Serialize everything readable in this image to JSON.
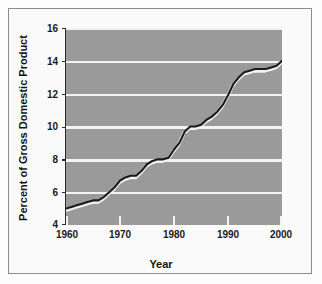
{
  "figure": {
    "background_color": "#fdfdfd",
    "frame_color": "#8c8c8c"
  },
  "chart_data": {
    "type": "line",
    "title": "",
    "xlabel": "Year",
    "ylabel": "Percent of Gross Domestic Product",
    "xlim": [
      1960,
      2000
    ],
    "ylim": [
      4,
      16
    ],
    "xticks": [
      "1960",
      "1970",
      "1980",
      "1990",
      "2000"
    ],
    "yticks": [
      "4",
      "6",
      "8",
      "10",
      "12",
      "14",
      "16"
    ],
    "grid": "horizontal",
    "legend": "none",
    "plot_background_color": "#9a9a9a",
    "gridline_color": "#f2f2f2",
    "line_color": "#1a1a1a",
    "line_highlight_color": "#f0f0f0",
    "series": [
      {
        "name": "Percent of Gross Domestic Product",
        "x": [
          1960,
          1961,
          1962,
          1963,
          1964,
          1965,
          1966,
          1967,
          1968,
          1969,
          1970,
          1971,
          1972,
          1973,
          1974,
          1975,
          1976,
          1977,
          1978,
          1979,
          1980,
          1981,
          1982,
          1983,
          1984,
          1985,
          1986,
          1987,
          1988,
          1989,
          1990,
          1991,
          1992,
          1993,
          1994,
          1995,
          1996,
          1997,
          1998,
          1999,
          2000
        ],
        "values": [
          5.0,
          5.1,
          5.2,
          5.3,
          5.4,
          5.5,
          5.5,
          5.7,
          6.0,
          6.3,
          6.7,
          6.9,
          7.0,
          7.0,
          7.3,
          7.7,
          7.9,
          8.0,
          8.0,
          8.1,
          8.6,
          9.0,
          9.7,
          10.0,
          10.0,
          10.1,
          10.4,
          10.6,
          10.9,
          11.3,
          11.9,
          12.6,
          13.0,
          13.3,
          13.4,
          13.5,
          13.5,
          13.5,
          13.6,
          13.7,
          14.0
        ]
      }
    ]
  }
}
